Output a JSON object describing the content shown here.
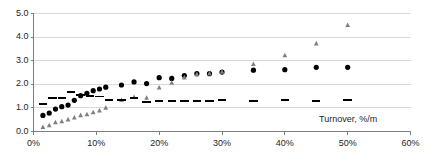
{
  "chart_data": {
    "type": "scatter",
    "title": "",
    "subtitle": "",
    "xlabel": "Turnover, %/m",
    "ylabel": "",
    "xlim": [
      0,
      60
    ],
    "ylim": [
      0,
      5
    ],
    "xticks": [
      0,
      10,
      20,
      30,
      40,
      50,
      60
    ],
    "xticklabels": [
      "0%",
      "10%",
      "20%",
      "30%",
      "40%",
      "50%",
      "60%"
    ],
    "yticks": [
      0.0,
      1.0,
      2.0,
      3.0,
      4.0,
      5.0
    ],
    "yticklabels": [
      "0.0",
      "1.0",
      "2.0",
      "3.0",
      "4.0",
      "5.0"
    ],
    "grid": "horizontal",
    "legend": "none",
    "colors": {
      "circle_series": "#000000",
      "triangle_series": "#808080",
      "dash_series": "#000000",
      "gridline": "#d9d9d9",
      "axis": "#7f7f7f",
      "text": "#262626",
      "background": "#ffffff"
    },
    "series": [
      {
        "name": "circle_series",
        "marker": "circle",
        "color": "#000000",
        "points": [
          [
            1.5,
            0.68
          ],
          [
            2.5,
            0.78
          ],
          [
            3.5,
            0.95
          ],
          [
            4.5,
            1.05
          ],
          [
            5.5,
            1.12
          ],
          [
            6.5,
            1.32
          ],
          [
            7.5,
            1.52
          ],
          [
            8.5,
            1.62
          ],
          [
            9.5,
            1.73
          ],
          [
            10.5,
            1.8
          ],
          [
            11.5,
            1.88
          ],
          [
            14.0,
            1.97
          ],
          [
            16.0,
            2.1
          ],
          [
            18.0,
            2.03
          ],
          [
            20.0,
            2.28
          ],
          [
            22.0,
            2.25
          ],
          [
            24.0,
            2.37
          ],
          [
            26.0,
            2.45
          ],
          [
            28.0,
            2.45
          ],
          [
            30.0,
            2.52
          ],
          [
            35.0,
            2.6
          ],
          [
            40.0,
            2.62
          ],
          [
            45.0,
            2.72
          ],
          [
            50.0,
            2.72
          ]
        ]
      },
      {
        "name": "triangle_series",
        "marker": "triangle",
        "color": "#808080",
        "points": [
          [
            1.5,
            0.18
          ],
          [
            2.5,
            0.25
          ],
          [
            3.5,
            0.38
          ],
          [
            4.5,
            0.42
          ],
          [
            5.5,
            0.5
          ],
          [
            6.5,
            0.58
          ],
          [
            7.5,
            0.68
          ],
          [
            8.5,
            0.72
          ],
          [
            9.5,
            0.8
          ],
          [
            10.5,
            0.88
          ],
          [
            11.5,
            1.0
          ],
          [
            14.0,
            1.32
          ],
          [
            16.0,
            1.45
          ],
          [
            18.0,
            1.42
          ],
          [
            20.0,
            1.85
          ],
          [
            22.0,
            2.05
          ],
          [
            24.0,
            2.28
          ],
          [
            26.0,
            2.42
          ],
          [
            28.0,
            2.45
          ],
          [
            30.0,
            2.52
          ],
          [
            35.0,
            2.85
          ],
          [
            40.0,
            3.22
          ],
          [
            45.0,
            3.72
          ],
          [
            50.0,
            4.5
          ]
        ]
      },
      {
        "name": "dash_series",
        "marker": "dash",
        "color": "#000000",
        "points": [
          [
            1.5,
            1.18
          ],
          [
            3.0,
            1.4
          ],
          [
            4.5,
            1.4
          ],
          [
            6.0,
            1.68
          ],
          [
            7.5,
            1.55
          ],
          [
            9.0,
            1.52
          ],
          [
            10.5,
            1.48
          ],
          [
            12.0,
            1.32
          ],
          [
            14.0,
            1.33
          ],
          [
            16.0,
            1.42
          ],
          [
            18.0,
            1.25
          ],
          [
            20.0,
            1.3
          ],
          [
            22.0,
            1.28
          ],
          [
            24.0,
            1.3
          ],
          [
            26.0,
            1.28
          ],
          [
            28.0,
            1.28
          ],
          [
            30.0,
            1.32
          ],
          [
            35.0,
            1.3
          ],
          [
            40.0,
            1.33
          ],
          [
            45.0,
            1.3
          ],
          [
            50.0,
            1.32
          ]
        ]
      }
    ]
  }
}
